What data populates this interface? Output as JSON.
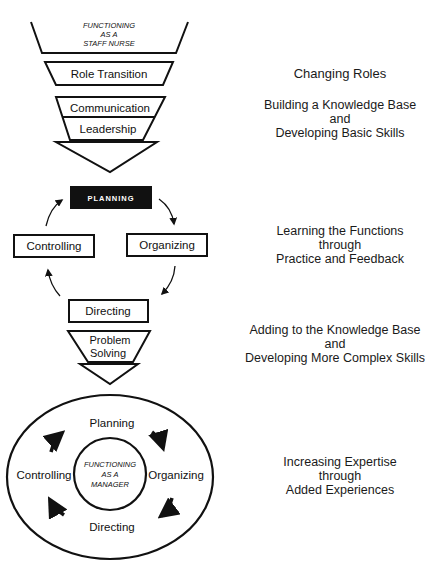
{
  "diagram": {
    "stages": {
      "staff_nurse": {
        "line1": "FUNCTIONING",
        "line2": "AS A",
        "line3": "STAFF NURSE"
      },
      "role_transition": "Role Transition",
      "communication": "Communication",
      "leadership": "Leadership",
      "cycle": {
        "planning": "PLANNING",
        "organizing": "Organizing",
        "directing": "Directing",
        "controlling": "Controlling"
      },
      "problem_solving": {
        "line1": "Problem",
        "line2": "Solving"
      },
      "manager_cycle": {
        "planning": "Planning",
        "organizing": "Organizing",
        "directing": "Directing",
        "controlling": "Controlling",
        "center": {
          "line1": "FUNCTIONING",
          "line2": "AS A",
          "line3": "MANAGER"
        }
      }
    },
    "descriptions": [
      {
        "lines": [
          "Changing Roles"
        ]
      },
      {
        "lines": [
          "Building a Knowledge Base",
          "and",
          "Developing Basic Skills"
        ]
      },
      {
        "lines": [
          "Learning the Functions",
          "through",
          "Practice and Feedback"
        ]
      },
      {
        "lines": [
          "Adding to the Knowledge Base",
          "and",
          "Developing More Complex Skills"
        ]
      },
      {
        "lines": [
          "Increasing Expertise",
          "through",
          "Added Experiences"
        ]
      }
    ],
    "colors": {
      "ink": "#111111",
      "paper": "#ffffff",
      "planning_fill": "#111111",
      "planning_text": "#ffffff"
    }
  }
}
